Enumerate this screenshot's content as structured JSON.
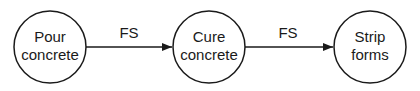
{
  "diagram": {
    "type": "activity-on-node precedence diagram",
    "nodes": [
      {
        "id": "pour",
        "lines": [
          "Pour",
          "concrete"
        ],
        "cx": 50,
        "cy": 47,
        "r": 36
      },
      {
        "id": "cure",
        "lines": [
          "Cure",
          "concrete"
        ],
        "cx": 209,
        "cy": 47,
        "r": 36
      },
      {
        "id": "strip",
        "lines": [
          "Strip",
          "forms"
        ],
        "cx": 370,
        "cy": 47,
        "r": 36
      }
    ],
    "edges": [
      {
        "from": "pour",
        "to": "cure",
        "label": "FS"
      },
      {
        "from": "cure",
        "to": "strip",
        "label": "FS"
      }
    ],
    "colors": {
      "stroke": "#1a1a1a",
      "background": "#ffffff"
    }
  }
}
